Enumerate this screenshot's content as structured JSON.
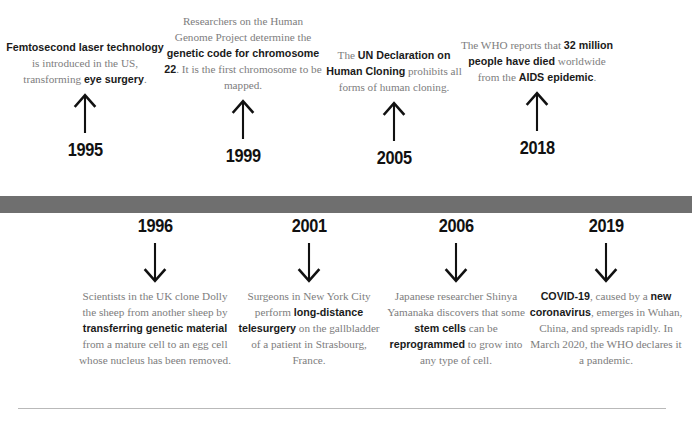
{
  "timeline": {
    "bar_color": "#6f6f6f",
    "text_color": "#7d7d7d",
    "highlight_color": "#1a1a1a",
    "events_above": [
      {
        "year": "1995",
        "arrow": "arrow-up-icon",
        "segments": [
          {
            "text": "Femtosecond laser technology",
            "bold": true
          },
          {
            "text": " is introduced in the US, transforming ",
            "bold": false
          },
          {
            "text": "eye surgery",
            "bold": true
          },
          {
            "text": ".",
            "bold": false
          }
        ]
      },
      {
        "year": "1999",
        "arrow": "arrow-up-icon",
        "segments": [
          {
            "text": "Researchers on the Human Genome Project determine the ",
            "bold": false
          },
          {
            "text": "genetic code for chromosome 22",
            "bold": true
          },
          {
            "text": ". It is the first chromosome to be mapped.",
            "bold": false
          }
        ]
      },
      {
        "year": "2005",
        "arrow": "arrow-up-icon",
        "segments": [
          {
            "text": "The ",
            "bold": false
          },
          {
            "text": "UN Declaration on Human Cloning",
            "bold": true
          },
          {
            "text": " prohibits all forms of human cloning.",
            "bold": false
          }
        ]
      },
      {
        "year": "2018",
        "arrow": "arrow-up-icon",
        "segments": [
          {
            "text": "The WHO reports that ",
            "bold": false
          },
          {
            "text": "32 million people have died",
            "bold": true
          },
          {
            "text": " worldwide from the ",
            "bold": false
          },
          {
            "text": "AIDS epidemic",
            "bold": true
          },
          {
            "text": ".",
            "bold": false
          }
        ]
      }
    ],
    "events_below": [
      {
        "year": "1996",
        "arrow": "arrow-down-icon",
        "segments": [
          {
            "text": "Scientists in the UK clone Dolly the sheep from another sheep by ",
            "bold": false
          },
          {
            "text": "transferring genetic material",
            "bold": true
          },
          {
            "text": " from a mature cell to an egg cell whose nucleus has been removed.",
            "bold": false
          }
        ]
      },
      {
        "year": "2001",
        "arrow": "arrow-down-icon",
        "segments": [
          {
            "text": "Surgeons in New York City perform ",
            "bold": false
          },
          {
            "text": "long-distance telesurgery",
            "bold": true
          },
          {
            "text": " on the gallbladder of a patient in Strasbourg, France.",
            "bold": false
          }
        ]
      },
      {
        "year": "2006",
        "arrow": "arrow-down-icon",
        "segments": [
          {
            "text": "Japanese researcher Shinya Yamanaka discovers that some ",
            "bold": false
          },
          {
            "text": "stem cells",
            "bold": true
          },
          {
            "text": " can be ",
            "bold": false
          },
          {
            "text": "reprogrammed",
            "bold": true
          },
          {
            "text": " to grow into any type of cell.",
            "bold": false
          }
        ]
      },
      {
        "year": "2019",
        "arrow": "arrow-down-icon",
        "segments": [
          {
            "text": "COVID-19",
            "bold": true
          },
          {
            "text": ", caused by a ",
            "bold": false
          },
          {
            "text": "new coronavirus",
            "bold": true
          },
          {
            "text": ", emerges in Wuhan, China, and spreads rapidly. In March 2020, the WHO declares it a pandemic.",
            "bold": false
          }
        ]
      }
    ]
  }
}
